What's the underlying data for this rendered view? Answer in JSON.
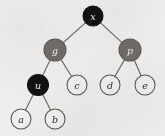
{
  "figure": {
    "kind": "binary-tree-diagram",
    "background_color": "#f1f0ee",
    "edge_color": "#6e6b68",
    "width": 165,
    "height": 136
  },
  "palette": {
    "black_node_fill": "#141210",
    "black_node_stroke": "#141210",
    "gray_node_fill": "#706d6a",
    "gray_node_stroke": "#5d5a57",
    "white_node_fill": "#f4f3f1",
    "white_node_stroke": "#565351",
    "dark_text": "#2b2927",
    "light_text": "#f2f1ef"
  },
  "nodes": [
    {
      "id": "x",
      "label": "x",
      "cx": 93,
      "cy": 16,
      "r": 10.0,
      "color": "black",
      "text_tone": "light",
      "depth": 0
    },
    {
      "id": "g",
      "label": "g",
      "cx": 55,
      "cy": 50,
      "r": 11.0,
      "color": "gray",
      "text_tone": "light",
      "depth": 1
    },
    {
      "id": "p",
      "label": "p",
      "cx": 130,
      "cy": 50,
      "r": 11.0,
      "color": "gray",
      "text_tone": "light",
      "depth": 1
    },
    {
      "id": "u",
      "label": "u",
      "cx": 38,
      "cy": 85,
      "r": 10.5,
      "color": "black",
      "text_tone": "light",
      "depth": 2
    },
    {
      "id": "c",
      "label": "c",
      "cx": 77,
      "cy": 85,
      "r": 10.0,
      "color": "white",
      "text_tone": "dark",
      "depth": 2
    },
    {
      "id": "d",
      "label": "d",
      "cx": 110,
      "cy": 85,
      "r": 10.0,
      "color": "white",
      "text_tone": "dark",
      "depth": 2
    },
    {
      "id": "e",
      "label": "e",
      "cx": 145,
      "cy": 85,
      "r": 10.0,
      "color": "white",
      "text_tone": "dark",
      "depth": 2
    },
    {
      "id": "a",
      "label": "a",
      "cx": 21,
      "cy": 119,
      "r": 10.0,
      "color": "white",
      "text_tone": "dark",
      "depth": 3
    },
    {
      "id": "b",
      "label": "b",
      "cx": 55,
      "cy": 119,
      "r": 10.0,
      "color": "white",
      "text_tone": "dark",
      "depth": 3
    }
  ],
  "edges": [
    {
      "from": "x",
      "to": "g"
    },
    {
      "from": "x",
      "to": "p"
    },
    {
      "from": "g",
      "to": "u"
    },
    {
      "from": "g",
      "to": "c"
    },
    {
      "from": "p",
      "to": "d"
    },
    {
      "from": "p",
      "to": "e"
    },
    {
      "from": "u",
      "to": "a"
    },
    {
      "from": "u",
      "to": "b"
    }
  ]
}
